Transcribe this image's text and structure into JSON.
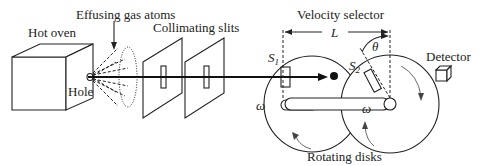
{
  "diagram": {
    "labels": {
      "hot_oven": "Hot oven",
      "effusing_gas_atoms": "Effusing gas atoms",
      "collimating_slits": "Collimating slits",
      "velocity_selector": "Velocity selector",
      "length": "L",
      "theta": "θ",
      "detector": "Detector",
      "hole": "Hole",
      "s1": "S",
      "s1_sub": "1",
      "s2": "S",
      "s2_sub": "2",
      "omega_left": "ω",
      "omega_right": "ω",
      "rotating_disks": "Rotating disks"
    }
  }
}
